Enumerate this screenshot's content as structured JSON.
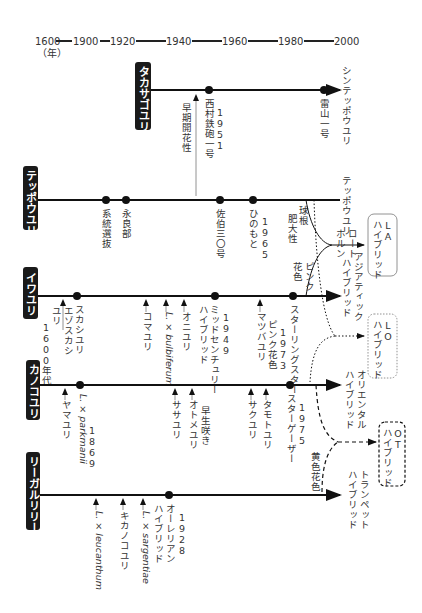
{
  "timeline": {
    "years": [
      "1600",
      "1900",
      "1920",
      "1940",
      "1960",
      "1980",
      "2000"
    ],
    "unit_label": "（年）"
  },
  "lines": [
    {
      "id": "takasago",
      "name": "タカサゴユリ",
      "end_label": "シンテッポウユリ",
      "events": [
        {
          "type": "arrow",
          "label": "早期開花性"
        },
        {
          "type": "dot",
          "label": "西村鉄砲一号",
          "year": "1951"
        },
        {
          "type": "dot",
          "label": "雷山一号"
        }
      ]
    },
    {
      "id": "teppo",
      "name": "テッポウユリ",
      "end_label": "テッポウユリ",
      "events": [
        {
          "type": "dot",
          "label": "系統選抜"
        },
        {
          "type": "dot",
          "label": "永良部"
        },
        {
          "type": "dot",
          "label": "佐伯三〇号"
        },
        {
          "type": "dot",
          "label": "ひのもと",
          "year": "1965"
        }
      ],
      "branch_label": "球根肥大性"
    },
    {
      "id": "iwa",
      "name": "イワユリ",
      "end_label": "アジアティックハイブリッド",
      "events": [
        {
          "type": "arrow",
          "label": "エゾスカシユリ",
          "year": "1600年代"
        },
        {
          "type": "dot",
          "label": "スカシユリ"
        },
        {
          "type": "arrow",
          "label": "コマユリ"
        },
        {
          "type": "arrow",
          "label": "L. × bulbiferum",
          "latin": true
        },
        {
          "type": "arrow",
          "label": "オニユリ"
        },
        {
          "type": "dot",
          "label": "ミッドセンチュリーハイブリッド",
          "year": "1949"
        },
        {
          "type": "arrow",
          "label": "マツバユリ"
        },
        {
          "type": "note",
          "label": "ピンク花色",
          "year": "1973"
        },
        {
          "type": "dot",
          "label": "スターリングスター"
        }
      ],
      "branch_label": "ピンク花色"
    },
    {
      "id": "kanoko",
      "name": "カノコユリ",
      "end_label": "オリエンタルハイブリッド",
      "events": [
        {
          "type": "arrow",
          "label": "ヤマユリ"
        },
        {
          "type": "dot",
          "label": "L. × parkmanii",
          "year": "1869",
          "latin": true
        },
        {
          "type": "arrow",
          "label": "ササユリ"
        },
        {
          "type": "arrow",
          "label": "オトメユリ",
          "note": "早生咲き"
        },
        {
          "type": "arrow",
          "label": "サクユリ"
        },
        {
          "type": "arrow",
          "label": "タモトユリ"
        },
        {
          "type": "dot",
          "label": "スターゲーザー",
          "year": "1975"
        }
      ]
    },
    {
      "id": "regal",
      "name": "リーガルリリー",
      "end_label": "トランペットハイブリッド",
      "events": [
        {
          "type": "arrow",
          "label": "L. × leucanthum",
          "latin": true
        },
        {
          "type": "arrow",
          "label": "キカノコユリ"
        },
        {
          "type": "arrow",
          "label": "L. × sargentiae",
          "latin": true
        },
        {
          "type": "dot",
          "label": "オーレリアンハイブリッド",
          "year": "1928"
        }
      ],
      "branch_label": "黄色花色"
    }
  ],
  "hybrids": {
    "la": {
      "label": "LAハイブリッド",
      "merge_label": "ロートホルン"
    },
    "lo": {
      "label": "LOハイブリッド"
    },
    "ot": {
      "label": "OTハイブリッド"
    }
  }
}
